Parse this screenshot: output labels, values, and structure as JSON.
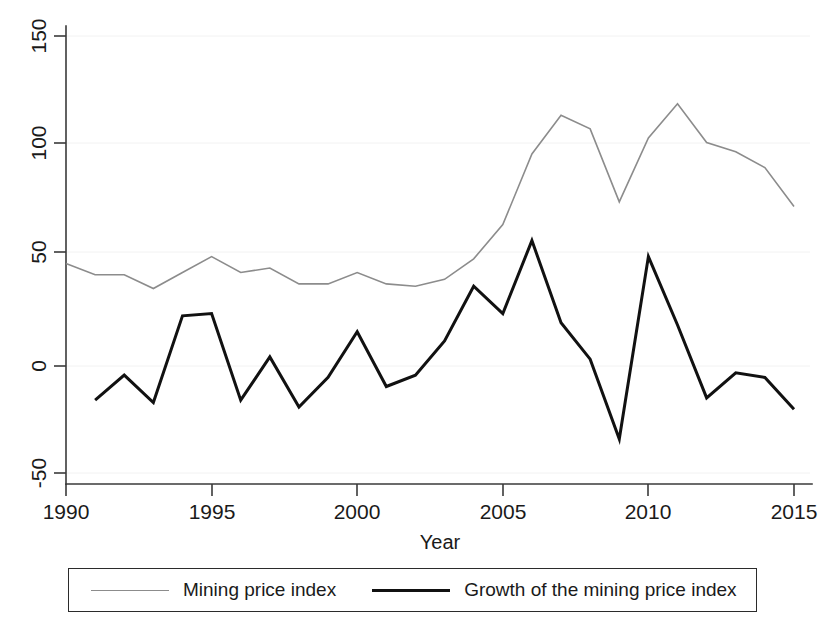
{
  "chart_data": {
    "type": "line",
    "title": "",
    "xlabel": "Year",
    "ylabel": "",
    "xlim": [
      1990,
      2015
    ],
    "ylim": [
      -50,
      150
    ],
    "xticks": [
      1990,
      1995,
      2000,
      2005,
      2010,
      2015
    ],
    "yticks": [
      -50,
      0,
      50,
      100,
      150
    ],
    "xtick_labels": [
      "1990",
      "1995",
      "2000",
      "2005",
      "2010",
      "2015"
    ],
    "ytick_labels": [
      "-50",
      "0",
      "50",
      "100",
      "150"
    ],
    "grid": false,
    "legend_position": "below-plot",
    "series": [
      {
        "name": "Mining price index",
        "color": "#8c8c8c",
        "width": 1.6,
        "x": [
          1990,
          1991,
          1992,
          1993,
          1994,
          1995,
          1996,
          1997,
          1998,
          1999,
          2000,
          2001,
          2002,
          2003,
          2004,
          2005,
          2006,
          2007,
          2008,
          2009,
          2010,
          2011,
          2012,
          2013,
          2014,
          2015
        ],
        "values": [
          45,
          40,
          40,
          34,
          41,
          48,
          41,
          43,
          36,
          36,
          41,
          36,
          35,
          38,
          47,
          62,
          93,
          110,
          104,
          72,
          100,
          115,
          98,
          94,
          87,
          70
        ]
      },
      {
        "name": "Growth of the mining price index",
        "color": "#111111",
        "width": 3,
        "x": [
          1991,
          1992,
          1993,
          1994,
          1995,
          1996,
          1997,
          1998,
          1999,
          2000,
          2001,
          2002,
          2003,
          2004,
          2005,
          2006,
          2007,
          2008,
          2009,
          2010,
          2011,
          2012,
          2013,
          2014,
          2015
        ],
        "values": [
          -15,
          -4,
          -16,
          22,
          23,
          -15,
          4,
          -18,
          -5,
          15,
          -9,
          -4,
          11,
          35,
          23,
          55,
          19,
          3,
          -32,
          48,
          18,
          -14,
          -3,
          -5,
          -19
        ]
      }
    ]
  },
  "axes": {
    "x_title": "Year",
    "x_tick_labels": [
      "1990",
      "1995",
      "2000",
      "2005",
      "2010",
      "2015"
    ],
    "y_tick_labels": [
      "150",
      "100",
      "50",
      "0",
      "-50"
    ]
  },
  "legend": {
    "items": [
      {
        "label": "Mining price index",
        "style": "gray",
        "swatch_name": "legend-swatch-mining-price-index"
      },
      {
        "label": "Growth of the mining price index",
        "style": "black",
        "swatch_name": "legend-swatch-growth-mining-price-index"
      }
    ]
  },
  "colors": {
    "mining_price_index": "#8c8c8c",
    "growth_mining_price_index": "#111111",
    "axis": "#3a3a3a",
    "background": "#ffffff"
  }
}
